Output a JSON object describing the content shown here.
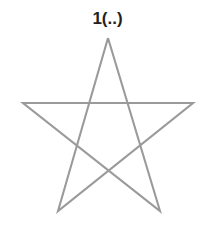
{
  "figure": {
    "label": "1(..)",
    "shape_name": "pentagram",
    "background_color": "#ffffff",
    "stroke_color": "#9a9a9a",
    "label_color": "#231f20",
    "stroke_width": 2.1,
    "vertices": {
      "apex": [
        108,
        38
      ],
      "right_point": [
        193,
        103
      ],
      "bottom_left_point": [
        58,
        211
      ],
      "top_left_point": [
        23,
        103
      ],
      "bottom_right_point": [
        160,
        211
      ]
    },
    "path_order": [
      "apex",
      "bottom_right_point",
      "top_left_point",
      "right_point",
      "bottom_left_point",
      "apex"
    ],
    "points_attr": "108,38 160,211 23,103 193,103 58,211 108,38"
  }
}
